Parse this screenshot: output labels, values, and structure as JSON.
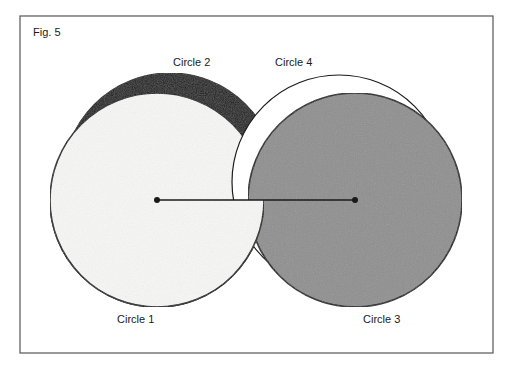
{
  "figure": {
    "title": "Fig. 5",
    "frame": {
      "x": 20,
      "y": 16,
      "width": 473,
      "height": 337,
      "stroke": "#555555"
    },
    "circles": [
      {
        "id": "circle-2",
        "label": "Circle 2",
        "cx": 170,
        "cy": 180,
        "r": 107,
        "fill": "#1c1c1c",
        "label_x": 173,
        "label_y": 66
      },
      {
        "id": "circle-1",
        "label": "Circle 1",
        "cx": 157,
        "cy": 200,
        "r": 107,
        "fill": "#f7f7f5",
        "label_x": 117,
        "label_y": 323
      },
      {
        "id": "circle-4",
        "label": "Circle 4",
        "cx": 339,
        "cy": 182,
        "r": 107,
        "fill": "#ffffff",
        "label_x": 275,
        "label_y": 66
      },
      {
        "id": "circle-3",
        "label": "Circle 3",
        "cx": 355,
        "cy": 200,
        "r": 107,
        "fill": "#8f8f8f",
        "label_x": 363,
        "label_y": 323
      }
    ],
    "center_line": {
      "x1": 157,
      "y1": 200,
      "x2": 355,
      "y2": 200
    },
    "stroke_color": "#1a1a1a"
  }
}
